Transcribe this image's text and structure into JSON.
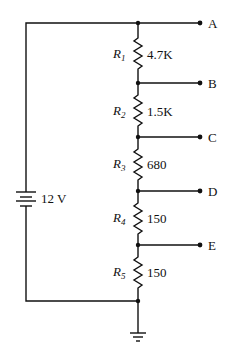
{
  "diagram": {
    "type": "voltage-divider circuit",
    "source": {
      "label": "12 V"
    },
    "resistors": [
      {
        "name": "R",
        "sub": "1",
        "value": "4.7K"
      },
      {
        "name": "R",
        "sub": "2",
        "value": "1.5K"
      },
      {
        "name": "R",
        "sub": "3",
        "value": "680"
      },
      {
        "name": "R",
        "sub": "4",
        "value": "150"
      },
      {
        "name": "R",
        "sub": "5",
        "value": "150"
      }
    ],
    "terminals": [
      "A",
      "B",
      "C",
      "D",
      "E"
    ]
  }
}
